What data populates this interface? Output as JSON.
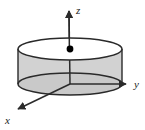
{
  "figure": {
    "background_color": "#ffffff",
    "canvas": {
      "width": 145,
      "height": 130
    }
  },
  "colors": {
    "stroke": "#2a2a2a",
    "axis": "#2b2b2b",
    "body_fill": "#d2d2d2",
    "top_face_fill": "#ffffff",
    "bottom_face_fill": "#c9c9c9",
    "point_fill": "#000000",
    "label_color": "#1c1c1c"
  },
  "axes": [
    {
      "name": "z-axis",
      "label": "z",
      "direction": "up",
      "origin": {
        "x": 70,
        "y": 84
      },
      "tip": {
        "x": 68,
        "y": 7
      },
      "label_position": {
        "x": 76,
        "y": 14
      },
      "arrowhead": true
    },
    {
      "name": "y-axis",
      "label": "y",
      "direction": "right",
      "origin": {
        "x": 70,
        "y": 84
      },
      "tip": {
        "x": 129,
        "y": 84
      },
      "label_position": {
        "x": 134,
        "y": 88
      },
      "arrowhead": true
    },
    {
      "name": "x-axis",
      "label": "x",
      "direction": "down-left",
      "origin": {
        "x": 70,
        "y": 84
      },
      "tip": {
        "x": 15,
        "y": 111
      },
      "label_position": {
        "x": 5,
        "y": 124
      },
      "arrowhead": true
    }
  ],
  "cylinder": {
    "center_x": 70,
    "radius_x": 52,
    "radius_y": 11,
    "top_center_y": 49,
    "bottom_center_y": 84,
    "height": 35,
    "stroke_width": 1.4
  },
  "point_marker": {
    "name": "center-point-top-face",
    "x": 70,
    "y": 49,
    "radius": 3.4,
    "filled": true
  }
}
